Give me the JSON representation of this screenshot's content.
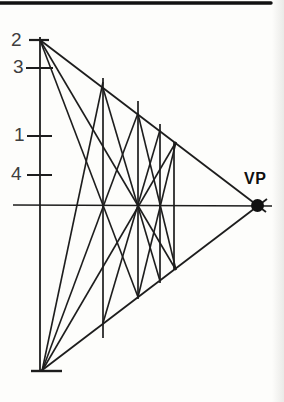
{
  "diagram": {
    "vp_label": "VP",
    "ink_color": "#1d1d1d",
    "frame_color": "#111111",
    "label_color": "#3e3e3e",
    "vp_point": {
      "x": 257.5,
      "y": 205.5,
      "r": 6.5
    },
    "frame_bar": {
      "x1": 0,
      "y1": 3,
      "x2": 271,
      "y2": 3,
      "w": 3.4
    },
    "scale_labels": [
      {
        "name": "scale-label-2",
        "text": "2",
        "x": 11,
        "y": 30
      },
      {
        "name": "scale-label-3",
        "text": "3",
        "x": 13,
        "y": 57
      },
      {
        "name": "scale-label-1",
        "text": "1",
        "x": 14,
        "y": 125
      },
      {
        "name": "scale-label-4",
        "text": "4",
        "x": 11,
        "y": 164
      }
    ],
    "segments": [
      {
        "name": "measuring-line",
        "x1": 40,
        "y1": 37,
        "x2": 40,
        "y2": 371,
        "w": 1.8
      },
      {
        "name": "tick-top",
        "x1": 29,
        "y1": 40,
        "x2": 49,
        "y2": 40,
        "w": 2.2
      },
      {
        "name": "tick-3",
        "x1": 26,
        "y1": 68,
        "x2": 53,
        "y2": 68,
        "w": 2.0
      },
      {
        "name": "tick-1",
        "x1": 27,
        "y1": 136,
        "x2": 52,
        "y2": 136,
        "w": 2.0
      },
      {
        "name": "tick-4",
        "x1": 27,
        "y1": 175,
        "x2": 52,
        "y2": 175,
        "w": 2.0
      },
      {
        "name": "tick-bottom",
        "x1": 31,
        "y1": 371,
        "x2": 62,
        "y2": 371,
        "w": 2.4
      },
      {
        "name": "horizon-line",
        "x1": 13,
        "y1": 205,
        "x2": 272,
        "y2": 206,
        "w": 1.6
      },
      {
        "name": "top-rail-to-vp",
        "x1": 40,
        "y1": 40,
        "x2": 266,
        "y2": 212,
        "w": 1.8
      },
      {
        "name": "bottom-rail-to-vp",
        "x1": 41,
        "y1": 371,
        "x2": 267,
        "y2": 199,
        "w": 1.8
      },
      {
        "name": "post-1",
        "x1": 103,
        "y1": 78,
        "x2": 103,
        "y2": 338,
        "w": 1.7
      },
      {
        "name": "post-2",
        "x1": 138,
        "y1": 101,
        "x2": 138,
        "y2": 299,
        "w": 1.7
      },
      {
        "name": "post-3",
        "x1": 160,
        "y1": 124,
        "x2": 160,
        "y2": 283,
        "w": 1.7
      },
      {
        "name": "post-4",
        "x1": 174,
        "y1": 142,
        "x2": 174,
        "y2": 270,
        "w": 1.7
      },
      {
        "name": "diagonal-top-through-node1",
        "x1": 40,
        "y1": 40,
        "x2": 138,
        "y2": 297,
        "w": 1.6
      },
      {
        "name": "diagonal-top-through-node2",
        "x1": 40,
        "y1": 40,
        "x2": 176,
        "y2": 270,
        "w": 1.6
      },
      {
        "name": "diagonal-post1-top-down",
        "x1": 103,
        "y1": 88,
        "x2": 160,
        "y2": 281,
        "w": 1.6
      },
      {
        "name": "diagonal-post2-top-down",
        "x1": 138,
        "y1": 114,
        "x2": 176,
        "y2": 270,
        "w": 1.6
      },
      {
        "name": "diagonal-bottom-through-node1",
        "x1": 42,
        "y1": 371,
        "x2": 138,
        "y2": 113,
        "w": 1.6
      },
      {
        "name": "diagonal-bottom-through-node2",
        "x1": 42,
        "y1": 371,
        "x2": 176,
        "y2": 142,
        "w": 1.6
      },
      {
        "name": "diagonal-post1-foot-up",
        "x1": 103,
        "y1": 323,
        "x2": 160,
        "y2": 130,
        "w": 1.6
      },
      {
        "name": "diagonal-post2-foot-up",
        "x1": 138,
        "y1": 297,
        "x2": 176,
        "y2": 142,
        "w": 1.6
      },
      {
        "name": "diagonal-bottom-to-post1-top",
        "x1": 42,
        "y1": 371,
        "x2": 103,
        "y2": 82,
        "w": 1.6
      }
    ]
  }
}
